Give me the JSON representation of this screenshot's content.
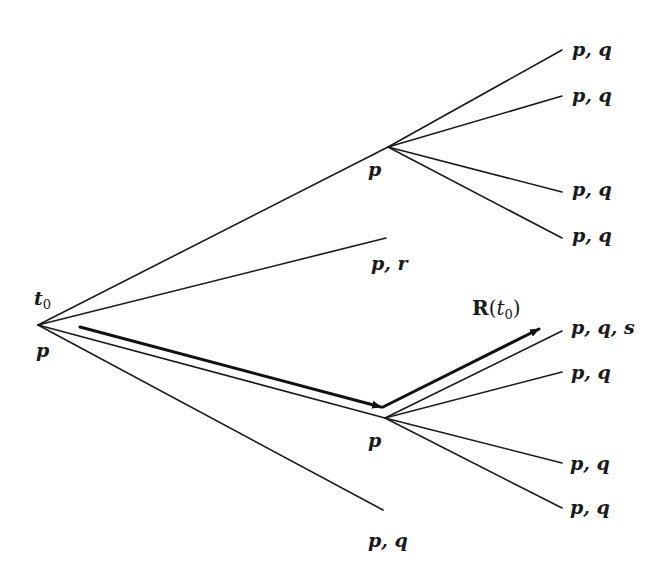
{
  "diagram": {
    "type": "branching-time-tree",
    "root": {
      "time_label": "t",
      "time_subscript": "0",
      "label": "p"
    },
    "nodes": {
      "upper": {
        "label": "p"
      },
      "lower": {
        "label": "p"
      }
    },
    "leaves": {
      "upper_1": "p, q",
      "upper_2": "p, q",
      "upper_3": "p, q",
      "upper_4": "p, q",
      "middle": "p, r",
      "lower_1": "p, q, s",
      "lower_2": "p, q",
      "lower_3": "p, q",
      "lower_4": "p, q",
      "bottom": "p, q"
    },
    "highlighted_path": {
      "label_bold": "R",
      "label_open": "(",
      "label_var": "t",
      "label_sub": "0",
      "label_close": ")"
    }
  }
}
